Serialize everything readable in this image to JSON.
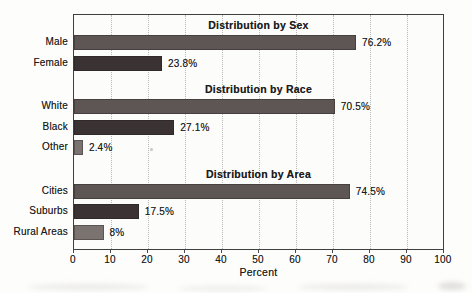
{
  "chart_data": {
    "type": "bar",
    "orientation": "horizontal",
    "xlabel": "Percent",
    "xlim": [
      0,
      100
    ],
    "xticks": [
      0,
      10,
      20,
      30,
      40,
      50,
      60,
      70,
      80,
      90,
      100
    ],
    "grid": "vertical-dotted",
    "legend_position": "none",
    "groups": [
      {
        "title": "Distribution by Sex",
        "bars": [
          {
            "label": "Male",
            "value": 76.2,
            "value_label": "76.2%",
            "color": "#5d5654"
          },
          {
            "label": "Female",
            "value": 23.8,
            "value_label": "23.8%",
            "color": "#3a3233"
          }
        ]
      },
      {
        "title": "Distribution by Race",
        "bars": [
          {
            "label": "White",
            "value": 70.5,
            "value_label": "70.5%",
            "color": "#5d5654"
          },
          {
            "label": "Black",
            "value": 27.1,
            "value_label": "27.1%",
            "color": "#3a3233"
          },
          {
            "label": "Other",
            "value": 2.4,
            "value_label": "2.4%",
            "color": "#7b7370"
          }
        ]
      },
      {
        "title": "Distribution by Area",
        "bars": [
          {
            "label": "Cities",
            "value": 74.5,
            "value_label": "74.5%",
            "color": "#5d5654"
          },
          {
            "label": "Suburbs",
            "value": 17.5,
            "value_label": "17.5%",
            "color": "#3a3233"
          },
          {
            "label": "Rural Areas",
            "value": 8,
            "value_label": "8%",
            "color": "#7b7370"
          }
        ]
      }
    ],
    "colors": {
      "bar_primary": "#5d5654",
      "bar_secondary": "#3a3233",
      "bar_tertiary": "#7b7370",
      "grid": "#b8b8b8",
      "plot_border": "#3f3f3f",
      "text": "#1b1b1b",
      "background": "#fdfdfc"
    }
  }
}
